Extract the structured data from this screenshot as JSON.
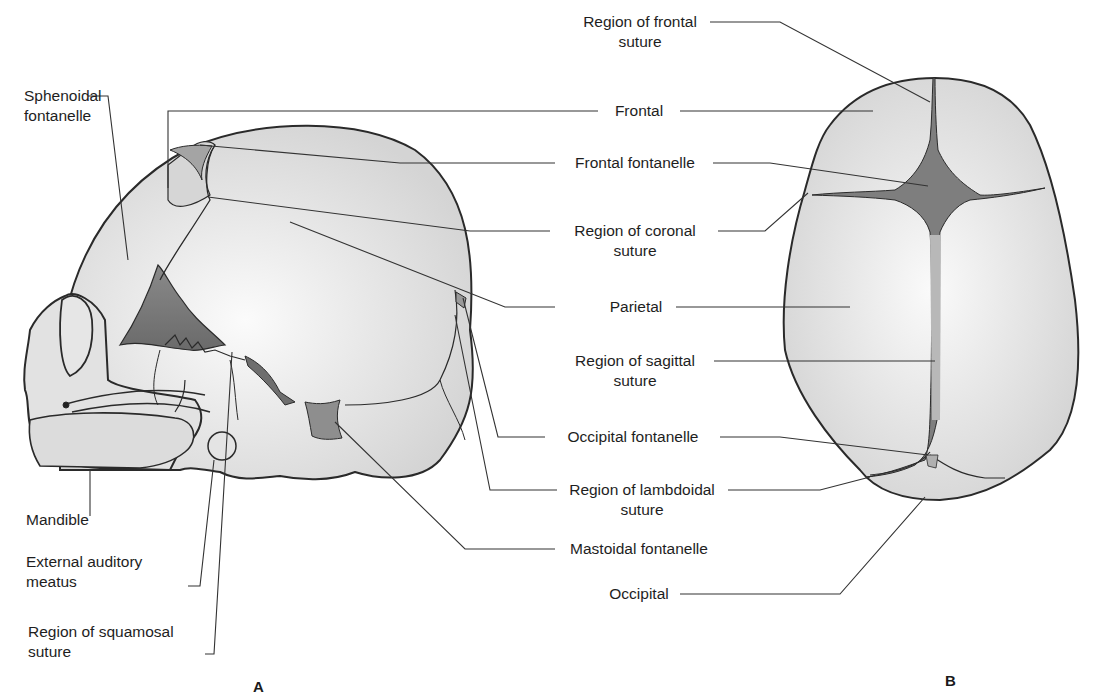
{
  "figure": {
    "panels": [
      {
        "id": "A",
        "label": "A",
        "view": "lateral"
      },
      {
        "id": "B",
        "label": "B",
        "view": "superior"
      }
    ],
    "colors": {
      "bone": "#dcdcdc",
      "bone_light": "#f4f4f4",
      "fontanelle": "#7a7a7a",
      "suture": "#b4b4b4",
      "outline": "#2a2a2a",
      "leader": "#333333"
    },
    "labels_a": {
      "sphenoidal": "Sphenoidal\nfontanelle",
      "sphenoidal_1": "Sphenoidal",
      "sphenoidal_2": "fontanelle",
      "mandible": "Mandible",
      "ext_aud_1": "External auditory",
      "ext_aud_2": "meatus",
      "squamosal_1": "Region of squamosal",
      "squamosal_2": "suture"
    },
    "labels_center": {
      "frontal_suture_1": "Region of frontal",
      "frontal_suture_2": "suture",
      "frontal": "Frontal",
      "frontal_fontanelle": "Frontal fontanelle",
      "coronal_1": "Region of coronal",
      "coronal_2": "suture",
      "parietal": "Parietal",
      "sagittal_1": "Region of sagittal",
      "sagittal_2": "suture",
      "occipital_fontanelle": "Occipital fontanelle",
      "lambdoidal_1": "Region of lambdoidal",
      "lambdoidal_2": "suture",
      "mastoidal_fontanelle": "Mastoidal fontanelle",
      "occipital": "Occipital"
    }
  }
}
